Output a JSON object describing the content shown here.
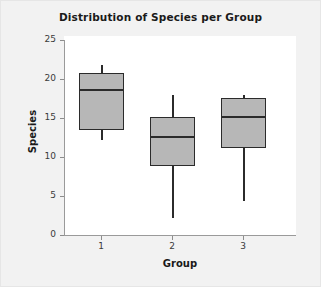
{
  "chart_data": {
    "type": "box",
    "title": "Distribution of Species per Group",
    "xlabel": "Group",
    "ylabel": "Species",
    "categories": [
      "1",
      "2",
      "3"
    ],
    "ylim": [
      0,
      25
    ],
    "yticks": [
      0,
      5,
      10,
      15,
      20,
      25
    ],
    "ytick_labels": [
      "0",
      "5",
      "10",
      "15",
      "20",
      "25"
    ],
    "grid": false,
    "legend": null,
    "box_fill_color": "#b7b7b7",
    "box_line_color": "#2b2b2b",
    "plot_background": "#ffffff",
    "canvas_background": "#f2f2f2",
    "boxes": [
      {
        "category": "1",
        "whisker_low": 12.2,
        "q1": 13.5,
        "median": 18.6,
        "q3": 20.8,
        "whisker_high": 21.8
      },
      {
        "category": "2",
        "whisker_low": 2.2,
        "q1": 8.8,
        "median": 12.6,
        "q3": 15.1,
        "whisker_high": 17.9
      },
      {
        "category": "3",
        "whisker_low": 4.4,
        "q1": 11.2,
        "median": 15.1,
        "q3": 17.6,
        "whisker_high": 17.9
      }
    ]
  }
}
